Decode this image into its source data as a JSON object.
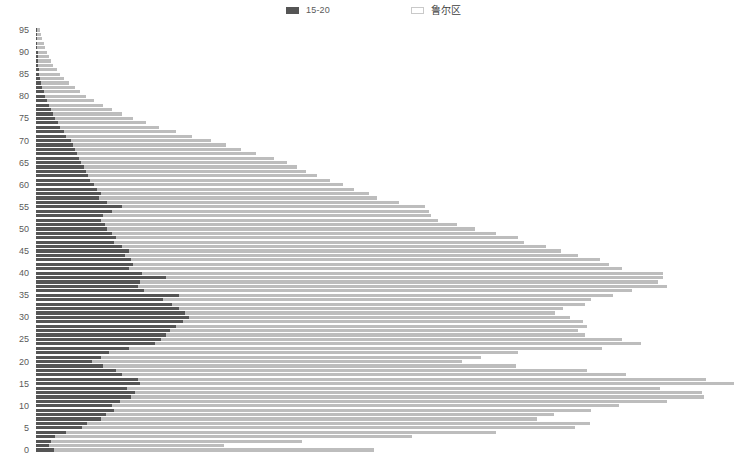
{
  "legend": {
    "position": "top",
    "items": [
      {
        "label": "15-20",
        "swatch": "filled-square-swatch",
        "color": "#555555"
      },
      {
        "label": "鲁尔区",
        "swatch": "outlined-square-swatch",
        "color": "#e8e8e8"
      }
    ]
  },
  "chart_data": {
    "type": "bar",
    "orientation": "horizontal",
    "stacked": true,
    "title": "",
    "xlabel": "",
    "ylabel": "",
    "grid": false,
    "legend_position": "top",
    "y_tick_labels": [
      "0",
      "5",
      "10",
      "15",
      "20",
      "25",
      "30",
      "35",
      "40",
      "45",
      "50",
      "55",
      "60",
      "65",
      "70",
      "75",
      "80",
      "85",
      "90",
      "95"
    ],
    "ylim": [
      0,
      96
    ],
    "xlim": [
      0,
      460
    ],
    "categories": [
      0,
      1,
      2,
      3,
      4,
      5,
      6,
      7,
      8,
      9,
      10,
      11,
      12,
      13,
      14,
      15,
      16,
      17,
      18,
      19,
      20,
      21,
      22,
      23,
      24,
      25,
      26,
      27,
      28,
      29,
      30,
      31,
      32,
      33,
      34,
      35,
      36,
      37,
      38,
      39,
      40,
      41,
      42,
      43,
      44,
      45,
      46,
      47,
      48,
      49,
      50,
      51,
      52,
      53,
      54,
      55,
      56,
      57,
      58,
      59,
      60,
      61,
      62,
      63,
      64,
      65,
      66,
      67,
      68,
      69,
      70,
      71,
      72,
      73,
      74,
      75,
      76,
      77,
      78,
      79,
      80,
      81,
      82,
      83,
      84,
      85,
      86,
      87,
      88,
      89,
      90,
      91,
      92,
      93,
      94,
      95
    ],
    "series": [
      {
        "name": "15-20",
        "color": "#555555",
        "values": [
          17,
          12,
          14,
          18,
          28,
          43,
          47,
          60,
          65,
          72,
          70,
          78,
          88,
          92,
          84,
          96,
          94,
          80,
          74,
          62,
          52,
          60,
          68,
          86,
          110,
          116,
          120,
          124,
          130,
          136,
          142,
          138,
          132,
          126,
          118,
          132,
          100,
          94,
          96,
          120,
          98,
          86,
          90,
          88,
          82,
          86,
          80,
          72,
          74,
          70,
          66,
          64,
          60,
          62,
          70,
          80,
          66,
          58,
          60,
          56,
          54,
          50,
          48,
          46,
          44,
          42,
          40,
          38,
          36,
          34,
          32,
          28,
          26,
          22,
          20,
          18,
          16,
          14,
          12,
          10,
          8,
          7,
          6,
          5,
          4,
          3,
          3,
          2,
          2,
          2,
          2,
          1,
          1,
          1,
          1,
          1
        ]
      },
      {
        "name": "鲁尔区",
        "color": "#bdbdbd",
        "values": [
          296,
          162,
          232,
          330,
          398,
          456,
          466,
          404,
          414,
          442,
          470,
          506,
          530,
          524,
          494,
          550,
          526,
          466,
          436,
          382,
          342,
          352,
          378,
          438,
          450,
          426,
          388,
          378,
          380,
          370,
          352,
          342,
          356,
          382,
          396,
          402,
          452,
          490,
          480,
          460,
          482,
          456,
          440,
          434,
          420,
          400,
          392,
          380,
          372,
          356,
          340,
          326,
          312,
          304,
          294,
          280,
          270,
          258,
          248,
          238,
          230,
          222,
          212,
          204,
          198,
          190,
          180,
          166,
          154,
          142,
          130,
          116,
          104,
          92,
          82,
          72,
          64,
          56,
          50,
          44,
          38,
          34,
          30,
          26,
          22,
          19,
          16,
          14,
          12,
          10,
          8,
          7,
          6,
          5,
          4,
          3
        ]
      }
    ]
  }
}
